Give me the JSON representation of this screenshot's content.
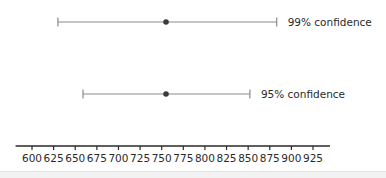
{
  "chart_data": {
    "type": "errorbar",
    "title": "",
    "xlabel": "",
    "ylabel": "",
    "xlim": [
      581,
      944
    ],
    "grid": false,
    "x_ticks": [
      600,
      625,
      650,
      675,
      700,
      725,
      750,
      775,
      800,
      825,
      850,
      875,
      900,
      925
    ],
    "series": [
      {
        "name": "99% confidence",
        "label": "99% confidence",
        "point": 755,
        "lower": 630,
        "upper": 883
      },
      {
        "name": "95% confidence",
        "label": "95% confidence",
        "point": 755,
        "lower": 659,
        "upper": 852
      }
    ]
  },
  "colors": {
    "line": "#8a8a8a",
    "point": "#3a3a3a",
    "axis": "#2a2a2a",
    "text": "#2a2a2a"
  }
}
